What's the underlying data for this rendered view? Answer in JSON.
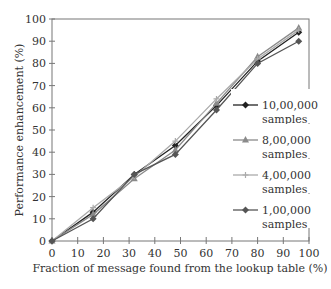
{
  "chart_data": {
    "type": "line",
    "title": "",
    "xlabel": "Fraction of message found from the lookup table (%)",
    "ylabel": "Performance enhancement (%)",
    "xlim": [
      0,
      100
    ],
    "ylim": [
      0,
      100
    ],
    "xticks": [
      0,
      10,
      20,
      30,
      40,
      50,
      60,
      70,
      80,
      90,
      100
    ],
    "yticks": [
      0,
      10,
      20,
      30,
      40,
      50,
      60,
      70,
      80,
      90,
      100
    ],
    "grid": false,
    "legend_position": "right-inside",
    "x": [
      0,
      16,
      32,
      48,
      64,
      80,
      96
    ],
    "series": [
      {
        "name": "10,00,000 samples",
        "label_line1": "10,00,000",
        "label_line2": "samples",
        "marker": "diamond",
        "color": "#222222",
        "values": [
          0,
          13,
          30,
          43,
          61,
          81,
          94
        ]
      },
      {
        "name": "8,00,000 samples",
        "label_line1": "8,00,000",
        "label_line2": "samples",
        "marker": "triangle",
        "color": "#8a8a8a",
        "values": [
          0,
          12,
          28,
          41,
          62,
          83,
          96
        ]
      },
      {
        "name": "4,00,000 samples",
        "label_line1": "4,00,000",
        "label_line2": "samples",
        "marker": "plus",
        "color": "#aaaaaa",
        "values": [
          0,
          15,
          29,
          45,
          64,
          82,
          95
        ]
      },
      {
        "name": "1,00,000 samples",
        "label_line1": "1,00,000",
        "label_line2": "samples",
        "marker": "diamond",
        "color": "#555555",
        "values": [
          0,
          10,
          30,
          39,
          59,
          80,
          90
        ]
      }
    ]
  }
}
